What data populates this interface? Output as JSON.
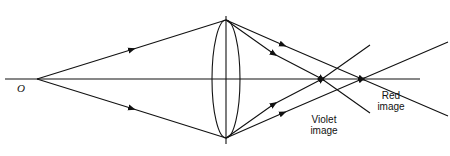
{
  "diagram": {
    "object_label": "O",
    "labels": {
      "violet_line1": "Violet",
      "violet_line2": "image",
      "red_line1": "Red",
      "red_line2": "image"
    },
    "colors": {
      "stroke": "#111111",
      "background": "#ffffff"
    }
  }
}
